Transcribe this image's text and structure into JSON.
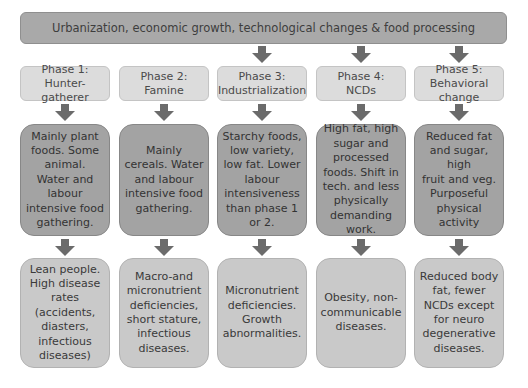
{
  "banner": {
    "text": "Urbanization, economic growth, technological changes & food processing"
  },
  "colors": {
    "banner_fill": "#a9a9a9",
    "phase_fill": "#dcdcdc",
    "middle_fill": "#a3a3a3",
    "bottom_fill": "#c9c9c9",
    "arrow": "#6b6b6b"
  },
  "phases": [
    {
      "label": "Phase 1:\nHunter-gatherer",
      "diet": "Mainly plant\nfoods. Some\nanimal.\nWater and\nlabour\nintensive food\ngathering.",
      "outcome": "Lean people.\nHigh disease\nrates\n(accidents,\ndiasters,\ninfectious\ndiseases)"
    },
    {
      "label": "Phase 2:\nFamine",
      "diet": "Mainly\ncereals. Water\nand labour\nintensive food\ngathering.",
      "outcome": "Macro-and\nmicronutrient\ndeficiencies,\nshort stature,\ninfectious\ndiseases."
    },
    {
      "label": "Phase 3:\nIndustrialization",
      "diet": "Starchy foods,\nlow variety,\nlow fat. Lower\nlabour\nintensiveness\nthan phase 1\nor 2.",
      "outcome": "Micronutrient\ndeficiencies.\nGrowth\nabnormalities."
    },
    {
      "label": "Phase 4:\nNCDs",
      "diet": "High fat, high\nsugar and\nprocessed\nfoods. Shift in\ntech. and less\nphysically\ndemanding\nwork.",
      "outcome": "Obesity, non-\ncommunicable\ndiseases."
    },
    {
      "label": "Phase 5:\nBehavioral change",
      "diet": "Reduced fat\nand sugar, high\nfruit and veg.\nPurposeful\nphysical\nactivity",
      "outcome": "Reduced body\nfat, fewer\nNCDs except\nfor neuro\ndegenerative\ndiseases."
    }
  ]
}
